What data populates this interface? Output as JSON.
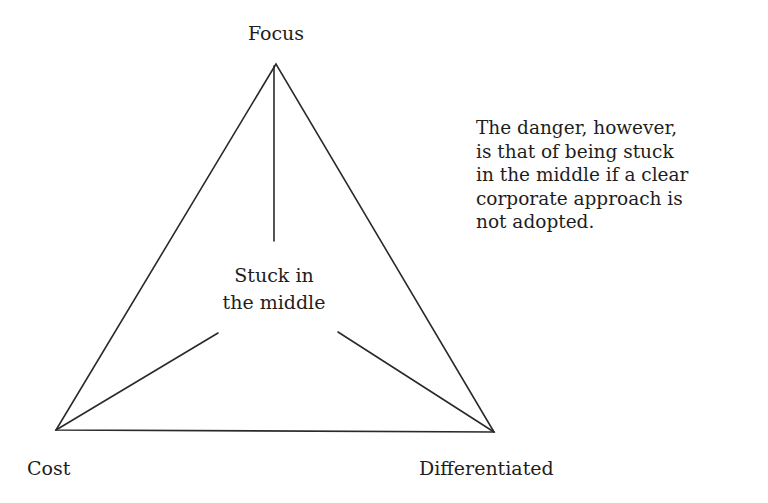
{
  "diagram": {
    "type": "strategy-triangle",
    "vertices": {
      "top": {
        "label": "Focus",
        "x": 276,
        "y": 64
      },
      "bottom_left": {
        "label": "Cost",
        "x": 56,
        "y": 430
      },
      "bottom_right": {
        "label": "Differentiated",
        "x": 494,
        "y": 432
      }
    },
    "center": {
      "lines": [
        "Stuck in",
        "the middle"
      ]
    },
    "inner_spokes": [
      {
        "from": "top",
        "x1": 274,
        "y1": 64,
        "x2": 274,
        "y2": 241
      },
      {
        "from": "bottom_left",
        "x1": 56,
        "y1": 430,
        "x2": 218,
        "y2": 333
      },
      {
        "from": "bottom_right",
        "x1": 494,
        "y1": 432,
        "x2": 338,
        "y2": 332
      }
    ],
    "line_color": "#2a2a2a"
  },
  "annotation": {
    "lines": [
      "The danger, however,",
      "is that of being stuck",
      "in the middle if a clear",
      "corporate approach is",
      "not adopted."
    ]
  }
}
